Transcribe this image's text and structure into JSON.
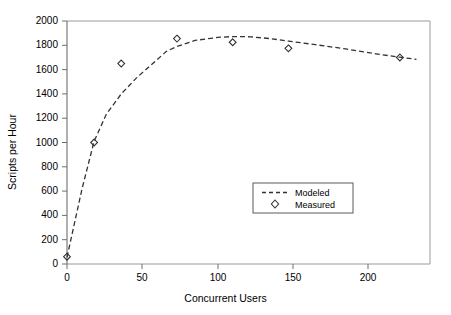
{
  "chart_data": {
    "type": "line",
    "title": "",
    "xlabel": "Concurrent Users",
    "ylabel": "Scripts per Hour",
    "xlim": [
      0,
      241
    ],
    "ylim": [
      0,
      2000
    ],
    "xticks": [
      0,
      50,
      100,
      150,
      200
    ],
    "yticks": [
      0,
      200,
      400,
      600,
      800,
      1000,
      1200,
      1400,
      1600,
      1800,
      2000
    ],
    "grid": false,
    "legend_position": "center-right",
    "series": [
      {
        "name": "Modeled",
        "style": "dashed-line",
        "marker": "none",
        "x": [
          0,
          10,
          18,
          26,
          36,
          46,
          56,
          66,
          73,
          85,
          100,
          110,
          122,
          135,
          147,
          165,
          185,
          205,
          221,
          232
        ],
        "y": [
          55,
          620,
          1010,
          1230,
          1400,
          1530,
          1640,
          1750,
          1790,
          1840,
          1865,
          1872,
          1870,
          1855,
          1835,
          1805,
          1770,
          1730,
          1702,
          1685
        ]
      },
      {
        "name": "Measured",
        "style": "none",
        "marker": "diamond",
        "x": [
          0,
          18,
          36,
          73,
          110,
          147,
          221
        ],
        "y": [
          60,
          1000,
          1650,
          1855,
          1825,
          1775,
          1700
        ]
      }
    ],
    "legend": [
      {
        "label": "Modeled",
        "symbol": "dashed-line"
      },
      {
        "label": "Measured",
        "symbol": "diamond"
      }
    ],
    "colors": {
      "line": "#333333",
      "marker": "#333333",
      "axis": "#808080",
      "text": "#000000",
      "background": "#ffffff"
    }
  }
}
